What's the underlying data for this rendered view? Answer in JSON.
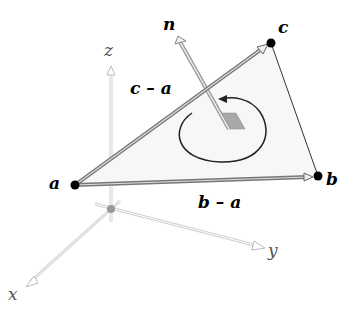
{
  "diagram": {
    "labels": {
      "vertex_a": "a",
      "vertex_b": "b",
      "vertex_c": "c",
      "normal": "n",
      "edge_ca": "c – a",
      "edge_ba": "b – a",
      "axis_x": "x",
      "axis_y": "y",
      "axis_z": "z"
    },
    "colors": {
      "vertex": "#000000",
      "edge_vector": "#888888",
      "triangle_fill": "#f7f7f7",
      "normal_patch": "#a8a8a8",
      "axes": "#cccccc",
      "origin": "#999999"
    }
  }
}
